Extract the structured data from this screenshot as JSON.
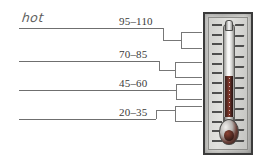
{
  "worksheet": {
    "rows": [
      {
        "id": "row-1",
        "answer": "hot",
        "range": "95–110",
        "filled": true
      },
      {
        "id": "row-2",
        "answer": "",
        "range": "70–85",
        "filled": false
      },
      {
        "id": "row-3",
        "answer": "",
        "range": "45–60",
        "filled": false
      },
      {
        "id": "row-4",
        "answer": "",
        "range": "20–35",
        "filled": false
      }
    ]
  },
  "thermometer": {
    "label": "thermometer-illustration",
    "tick_count_left": 13,
    "tick_count_right": 12,
    "fluid_level_percent": 52,
    "colors": {
      "frame": "#3b3b3b",
      "face": "#d4d4d1",
      "fluid": "#5e2b22",
      "tick": "#2f2f2f"
    }
  },
  "style": {
    "line_color": "#6f6f6f",
    "connector_color": "#777777",
    "text_color": "#3a3a3a",
    "handwriting_color": "#5d5d5d",
    "background": "#ffffff"
  }
}
